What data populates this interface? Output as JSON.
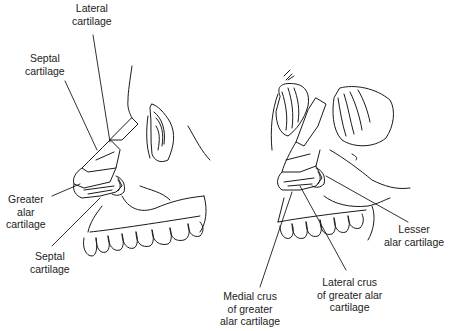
{
  "figure": {
    "left_view": {
      "labels": {
        "lateral_cartilage": [
          "Lateral",
          "cartilage"
        ],
        "septal_cartilage_top": [
          "Septal",
          "cartilage"
        ],
        "greater_alar_cartilage": [
          "Greater",
          "alar",
          "cartilage"
        ],
        "septal_cartilage_bottom": [
          "Septal",
          "cartilage"
        ]
      }
    },
    "right_view": {
      "labels": {
        "lesser_alar_cartilage": [
          "Lesser",
          "alar cartilage"
        ],
        "medial_crus": [
          "Medial crus",
          "of greater",
          "alar cartilage"
        ],
        "lateral_crus": [
          "Lateral crus",
          "of greater alar",
          "cartilage"
        ]
      }
    },
    "colors": {
      "line": "#1a1a1a",
      "text": "#222222",
      "background": "#ffffff"
    }
  }
}
